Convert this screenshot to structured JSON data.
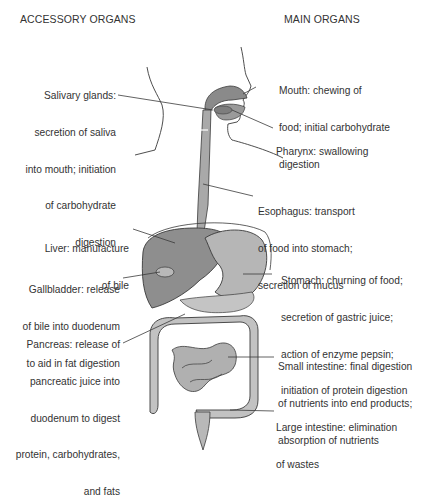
{
  "headers": {
    "left": "ACCESSORY ORGANS",
    "right": "MAIN ORGANS"
  },
  "accessory_organs": [
    {
      "organ": "Salivary glands",
      "lines": [
        "Salivary glands:",
        "secretion of saliva",
        "into mouth; initiation",
        "of carbohydrate",
        "digestion"
      ]
    },
    {
      "organ": "Liver",
      "lines": [
        "Liver: manufacture",
        "of bile"
      ]
    },
    {
      "organ": "Gallbladder",
      "lines": [
        "Gallbladder: release",
        "of bile into duodenum",
        "to aid in fat digestion"
      ]
    },
    {
      "organ": "Pancreas",
      "lines": [
        "Pancreas: release of",
        "pancreatic juice into",
        "duodenum to digest",
        "protein, carbohydrates,",
        "and fats"
      ]
    }
  ],
  "main_organs": [
    {
      "organ": "Mouth",
      "lines": [
        "Mouth: chewing of",
        "food; initial carbohydrate",
        "digestion"
      ]
    },
    {
      "organ": "Pharynx",
      "lines": [
        "Pharynx: swallowing"
      ]
    },
    {
      "organ": "Esophagus",
      "lines": [
        "Esophagus: transport",
        "of food into stomach;",
        "secretion of mucus"
      ]
    },
    {
      "organ": "Stomach",
      "lines": [
        "Stomach: churning of food;",
        "secretion of gastric juice;",
        "action of enzyme pepsin;",
        "initiation of protein digestion"
      ]
    },
    {
      "organ": "Small intestine",
      "lines": [
        "Small intestine: final digestion",
        "of nutrients into end products;",
        "absorption of nutrients"
      ]
    },
    {
      "organ": "Large intestine",
      "lines": [
        "Large intestine: elimination",
        "of wastes"
      ]
    }
  ],
  "colors": {
    "organ_fill": "#a9a9a9",
    "organ_dark": "#7d7d7d",
    "outline": "#3a3a3a",
    "text": "#333333"
  }
}
